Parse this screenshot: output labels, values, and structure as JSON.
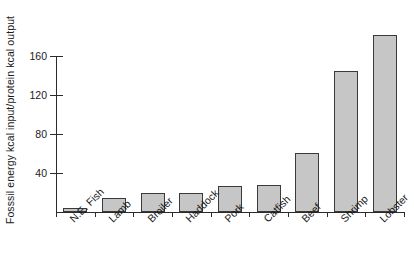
{
  "chart_data": {
    "type": "bar",
    "title": "",
    "xlabel": "",
    "ylabel": "Fosssil energy kcal input/protein kcal output",
    "categories": [
      "N.E. Fish",
      "Lamb",
      "Broiler",
      "Haddock",
      "Pork",
      "Catfish",
      "Beef",
      "Shrimp",
      "Lobster"
    ],
    "values": [
      4,
      14,
      19,
      20,
      27,
      28,
      61,
      145,
      182
    ],
    "ylim": [
      0,
      182
    ],
    "yticks": [
      40,
      80,
      120,
      160
    ],
    "ytick_labels": [
      "40",
      "80",
      "120",
      "160"
    ],
    "grid": false,
    "legend": null,
    "bar_fill_color": "#c6c6c6",
    "bar_edge_color": "#3a3a3a",
    "axis_color": "#2b2b2b",
    "background_color": "#ffffff"
  }
}
